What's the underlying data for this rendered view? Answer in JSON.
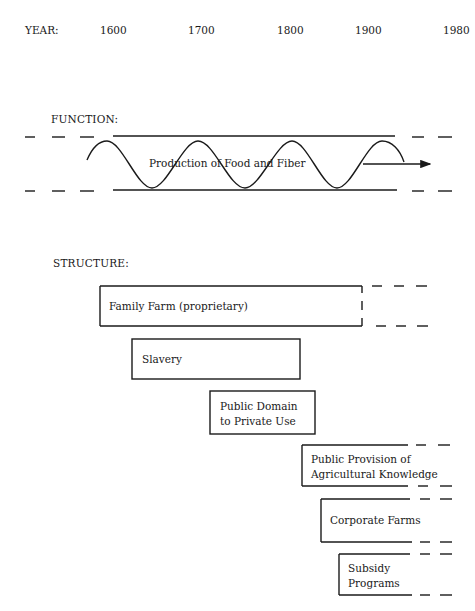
{
  "timeline": {
    "label": "YEAR:",
    "years": [
      "1600",
      "1700",
      "1800",
      "1900",
      "1980"
    ]
  },
  "function": {
    "header": "FUNCTION:",
    "band_label": "Production of Food and Fiber"
  },
  "structure": {
    "header": "STRUCTURE:",
    "items": [
      {
        "label": "Family Farm (proprietary)",
        "lines": [
          "Family Farm (proprietary)"
        ]
      },
      {
        "label": "Slavery",
        "lines": [
          "Slavery"
        ]
      },
      {
        "label": "Public Domain to Private Use",
        "lines": [
          "Public Domain",
          "to Private Use"
        ]
      },
      {
        "label": "Public Provision of Agricultural Knowledge",
        "lines": [
          "Public Provision of",
          "Agricultural Knowledge"
        ]
      },
      {
        "label": "Corporate Farms",
        "lines": [
          "Corporate Farms"
        ]
      },
      {
        "label": "Subsidy Programs",
        "lines": [
          "Subsidy",
          "Programs"
        ]
      }
    ]
  },
  "colors": {
    "ink": "#1a1a1a",
    "background": "#ffffff"
  }
}
